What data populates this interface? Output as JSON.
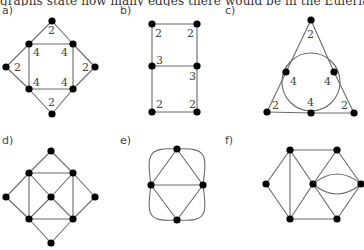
{
  "caption": "graphs state how many edges there would be in the Eulerian trail.",
  "graphs": [
    {
      "label": "a)",
      "nodes": {
        "top": [
          52,
          21
        ],
        "ul": [
          29,
          44
        ],
        "ur": [
          73,
          44
        ],
        "l": [
          6,
          67
        ],
        "r": [
          95,
          67
        ],
        "ll": [
          29,
          89
        ],
        "lr": [
          73,
          89
        ],
        "bottom": [
          52,
          114
        ]
      },
      "edges": [
        [
          "top",
          "ul"
        ],
        [
          "top",
          "ur"
        ],
        [
          "ul",
          "ur"
        ],
        [
          "ul",
          "l"
        ],
        [
          "l",
          "ll"
        ],
        [
          "ul",
          "ll"
        ],
        [
          "ur",
          "r"
        ],
        [
          "r",
          "lr"
        ],
        [
          "ur",
          "lr"
        ],
        [
          "ll",
          "lr"
        ],
        [
          "ll",
          "bottom"
        ],
        [
          "lr",
          "bottom"
        ]
      ],
      "degree_labels": [
        {
          "text": "2",
          "x": 48,
          "y": 34
        },
        {
          "text": "4",
          "x": 33,
          "y": 56
        },
        {
          "text": "4",
          "x": 61,
          "y": 56
        },
        {
          "text": "2",
          "x": 14,
          "y": 71
        },
        {
          "text": "2",
          "x": 82,
          "y": 71
        },
        {
          "text": "4",
          "x": 33,
          "y": 86
        },
        {
          "text": "4",
          "x": 61,
          "y": 86
        },
        {
          "text": "2",
          "x": 48,
          "y": 106
        }
      ]
    },
    {
      "label": "b)",
      "nodes": {
        "tl": [
          152,
          24
        ],
        "tr": [
          197,
          24
        ],
        "ml": [
          152,
          66
        ],
        "mr": [
          197,
          66
        ],
        "bl": [
          152,
          112
        ],
        "br": [
          197,
          112
        ]
      },
      "edges": [
        [
          "tl",
          "tr"
        ],
        [
          "tl",
          "ml"
        ],
        [
          "tr",
          "mr"
        ],
        [
          "ml",
          "mr"
        ],
        [
          "ml",
          "bl"
        ],
        [
          "mr",
          "br"
        ],
        [
          "bl",
          "br"
        ]
      ],
      "degree_labels": [
        {
          "text": "2",
          "x": 155,
          "y": 37
        },
        {
          "text": "2",
          "x": 187,
          "y": 37
        },
        {
          "text": "3",
          "x": 156,
          "y": 64
        },
        {
          "text": "3",
          "x": 189,
          "y": 80
        },
        {
          "text": "2",
          "x": 156,
          "y": 108
        },
        {
          "text": "2",
          "x": 189,
          "y": 108
        }
      ]
    },
    {
      "label": "c)",
      "nodes": {
        "apex": [
          311,
          20
        ],
        "lt": [
          286,
          72
        ],
        "rt": [
          334,
          72
        ],
        "bl": [
          267,
          112
        ],
        "bm": [
          311,
          113
        ],
        "br": [
          354,
          113
        ]
      },
      "edges": [
        [
          "apex",
          "lt"
        ],
        [
          "lt",
          "bl"
        ],
        [
          "apex",
          "rt"
        ],
        [
          "rt",
          "br"
        ],
        [
          "bl",
          "bm"
        ],
        [
          "bm",
          "br"
        ]
      ],
      "circle": {
        "cx": 311,
        "cy": 82,
        "r": 29
      },
      "degree_labels": [
        {
          "text": "2",
          "x": 307,
          "y": 38
        },
        {
          "text": "4",
          "x": 290,
          "y": 85
        },
        {
          "text": "4",
          "x": 324,
          "y": 85
        },
        {
          "text": "2",
          "x": 272,
          "y": 109
        },
        {
          "text": "4",
          "x": 307,
          "y": 106
        },
        {
          "text": "2",
          "x": 341,
          "y": 109
        }
      ]
    },
    {
      "label": "d)",
      "nodes": {
        "top": [
          51,
          151
        ],
        "ul": [
          29,
          173
        ],
        "ur": [
          73,
          173
        ],
        "l": [
          6,
          197
        ],
        "c": [
          51,
          197
        ],
        "r": [
          95,
          197
        ],
        "ll": [
          29,
          219
        ],
        "lr": [
          73,
          219
        ],
        "bottom": [
          51,
          243
        ]
      },
      "edges": [
        [
          "top",
          "ul"
        ],
        [
          "top",
          "ur"
        ],
        [
          "ul",
          "ur"
        ],
        [
          "ul",
          "l"
        ],
        [
          "l",
          "ll"
        ],
        [
          "ul",
          "ll"
        ],
        [
          "ur",
          "r"
        ],
        [
          "r",
          "lr"
        ],
        [
          "ur",
          "lr"
        ],
        [
          "ll",
          "lr"
        ],
        [
          "ll",
          "bottom"
        ],
        [
          "lr",
          "bottom"
        ],
        [
          "ul",
          "c"
        ],
        [
          "ur",
          "c"
        ],
        [
          "ll",
          "c"
        ],
        [
          "lr",
          "c"
        ]
      ],
      "degree_labels": []
    },
    {
      "label": "e)",
      "nodes": {
        "top": [
          177,
          149
        ],
        "l": [
          151,
          185
        ],
        "r": [
          203,
          185
        ],
        "bottom": [
          177,
          220
        ]
      },
      "edges": [
        [
          "top",
          "l"
        ],
        [
          "top",
          "r"
        ],
        [
          "l",
          "r"
        ],
        [
          "l",
          "bottom"
        ],
        [
          "r",
          "bottom"
        ]
      ],
      "degree_labels": []
    },
    {
      "label": "f)",
      "nodes": {
        "tl": [
          290,
          150
        ],
        "tr": [
          337,
          150
        ],
        "l": [
          266,
          184
        ],
        "c": [
          313,
          184
        ],
        "r": [
          361,
          184
        ],
        "bl": [
          290,
          219
        ],
        "br": [
          337,
          219
        ]
      },
      "edges": [
        [
          "tl",
          "tr"
        ],
        [
          "l",
          "tl"
        ],
        [
          "l",
          "bl"
        ],
        [
          "tl",
          "bl"
        ],
        [
          "tl",
          "c"
        ],
        [
          "bl",
          "c"
        ],
        [
          "c",
          "tr"
        ],
        [
          "c",
          "br"
        ],
        [
          "tr",
          "r"
        ],
        [
          "br",
          "r"
        ],
        [
          "bl",
          "br"
        ]
      ],
      "degree_labels": []
    }
  ]
}
